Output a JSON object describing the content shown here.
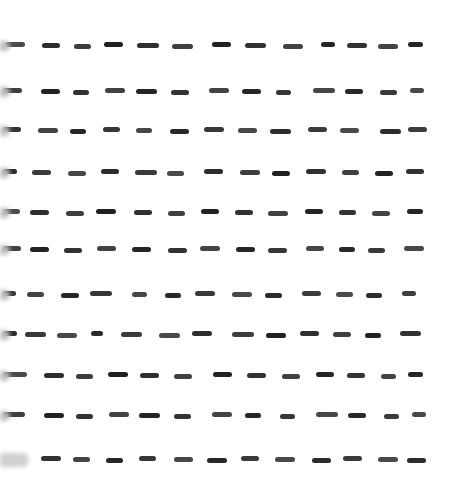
{
  "image": {
    "type": "western-blot",
    "background": "#ffffff",
    "band_color": "#1e1e1e",
    "rows": [
      {
        "y": 46,
        "bands": [
          [
            5,
            20
          ],
          [
            42,
            18
          ],
          [
            74,
            17
          ],
          [
            104,
            19
          ],
          [
            137,
            22
          ],
          [
            172,
            21
          ],
          [
            212,
            19
          ],
          [
            245,
            21
          ],
          [
            283,
            20
          ],
          [
            321,
            14
          ],
          [
            347,
            20
          ],
          [
            378,
            20
          ],
          [
            408,
            15
          ]
        ]
      },
      {
        "y": 92,
        "bands": [
          [
            3,
            19
          ],
          [
            41,
            19
          ],
          [
            73,
            16
          ],
          [
            105,
            20
          ],
          [
            136,
            21
          ],
          [
            171,
            18
          ],
          [
            209,
            20
          ],
          [
            242,
            19
          ],
          [
            276,
            15
          ],
          [
            313,
            22
          ],
          [
            345,
            18
          ],
          [
            380,
            17
          ],
          [
            410,
            14
          ]
        ]
      },
      {
        "y": 131,
        "bands": [
          [
            3,
            18
          ],
          [
            38,
            20
          ],
          [
            70,
            16
          ],
          [
            103,
            17
          ],
          [
            136,
            16
          ],
          [
            170,
            19
          ],
          [
            204,
            20
          ],
          [
            238,
            19
          ],
          [
            270,
            21
          ],
          [
            308,
            19
          ],
          [
            340,
            19
          ],
          [
            380,
            21
          ],
          [
            408,
            19
          ]
        ]
      },
      {
        "y": 173,
        "bands": [
          [
            3,
            14
          ],
          [
            32,
            19
          ],
          [
            68,
            18
          ],
          [
            101,
            18
          ],
          [
            135,
            22
          ],
          [
            167,
            17
          ],
          [
            204,
            19
          ],
          [
            240,
            20
          ],
          [
            272,
            18
          ],
          [
            306,
            20
          ],
          [
            342,
            17
          ],
          [
            375,
            18
          ],
          [
            406,
            18
          ]
        ]
      },
      {
        "y": 213,
        "bands": [
          [
            3,
            17
          ],
          [
            30,
            19
          ],
          [
            66,
            18
          ],
          [
            96,
            20
          ],
          [
            134,
            18
          ],
          [
            168,
            17
          ],
          [
            201,
            18
          ],
          [
            235,
            18
          ],
          [
            268,
            20
          ],
          [
            305,
            18
          ],
          [
            339,
            17
          ],
          [
            372,
            18
          ],
          [
            407,
            16
          ]
        ]
      },
      {
        "y": 250,
        "bands": [
          [
            3,
            18
          ],
          [
            30,
            19
          ],
          [
            64,
            18
          ],
          [
            97,
            19
          ],
          [
            132,
            19
          ],
          [
            168,
            19
          ],
          [
            200,
            20
          ],
          [
            236,
            19
          ],
          [
            268,
            19
          ],
          [
            306,
            18
          ],
          [
            339,
            16
          ],
          [
            368,
            17
          ],
          [
            404,
            20
          ]
        ]
      },
      {
        "y": 295,
        "bands": [
          [
            3,
            13
          ],
          [
            27,
            17
          ],
          [
            61,
            18
          ],
          [
            90,
            22
          ],
          [
            132,
            15
          ],
          [
            165,
            16
          ],
          [
            195,
            20
          ],
          [
            232,
            20
          ],
          [
            265,
            17
          ],
          [
            302,
            19
          ],
          [
            336,
            17
          ],
          [
            366,
            16
          ],
          [
            402,
            14
          ]
        ]
      },
      {
        "y": 335,
        "bands": [
          [
            3,
            14
          ],
          [
            25,
            21
          ],
          [
            57,
            20
          ],
          [
            91,
            12
          ],
          [
            121,
            21
          ],
          [
            159,
            21
          ],
          [
            192,
            20
          ],
          [
            232,
            22
          ],
          [
            266,
            20
          ],
          [
            300,
            19
          ],
          [
            333,
            18
          ],
          [
            365,
            16
          ],
          [
            400,
            21
          ]
        ]
      },
      {
        "y": 376,
        "bands": [
          [
            3,
            24
          ],
          [
            44,
            20
          ],
          [
            76,
            17
          ],
          [
            108,
            20
          ],
          [
            140,
            19
          ],
          [
            174,
            18
          ],
          [
            213,
            19
          ],
          [
            247,
            19
          ],
          [
            282,
            18
          ],
          [
            316,
            18
          ],
          [
            347,
            18
          ],
          [
            381,
            15
          ],
          [
            408,
            15
          ]
        ]
      },
      {
        "y": 416,
        "bands": [
          [
            3,
            22
          ],
          [
            44,
            20
          ],
          [
            76,
            17
          ],
          [
            109,
            20
          ],
          [
            139,
            21
          ],
          [
            174,
            17
          ],
          [
            212,
            20
          ],
          [
            245,
            16
          ],
          [
            280,
            15
          ],
          [
            316,
            22
          ],
          [
            348,
            18
          ],
          [
            384,
            15
          ],
          [
            412,
            14
          ]
        ]
      },
      {
        "y": 460,
        "bands": [
          [
            41,
            20
          ],
          [
            73,
            17
          ],
          [
            106,
            17
          ],
          [
            139,
            17
          ],
          [
            174,
            19
          ],
          [
            207,
            20
          ],
          [
            241,
            18
          ],
          [
            275,
            20
          ],
          [
            312,
            19
          ],
          [
            343,
            19
          ],
          [
            378,
            20
          ],
          [
            407,
            19
          ]
        ]
      }
    ],
    "edge_marks": [
      46,
      92,
      131,
      173,
      213,
      250,
      295,
      335,
      376,
      416,
      460
    ]
  }
}
